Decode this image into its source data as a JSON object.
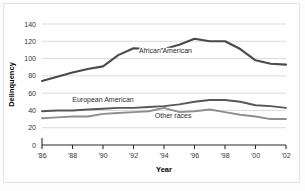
{
  "figure": {
    "background_color": "#ffffff",
    "border_color": "#e3e3e3"
  },
  "chart_data": {
    "type": "line",
    "title": "",
    "subtitle": "",
    "xlabel": "Year",
    "ylabel": "Delinquency",
    "xlim": [
      1986,
      2002
    ],
    "ylim": [
      0,
      140
    ],
    "grid": true,
    "grid_axis": "y",
    "legend_position": "inline-annotations",
    "x": [
      1986,
      1987,
      1988,
      1989,
      1990,
      1991,
      1992,
      1993,
      1994,
      1995,
      1996,
      1997,
      1998,
      1999,
      2000,
      2001,
      2002
    ],
    "xtick_values": [
      1986,
      1988,
      1990,
      1992,
      1994,
      1996,
      1998,
      2000,
      2002
    ],
    "xtick_labels": [
      "'86",
      "'88",
      "'90",
      "'92",
      "'94",
      "'96",
      "'98",
      "'00",
      "'02"
    ],
    "ytick_values": [
      0,
      20,
      40,
      60,
      80,
      100,
      120,
      140
    ],
    "ytick_labels": [
      "0",
      "20",
      "40",
      "60",
      "80",
      "100",
      "120",
      "140"
    ],
    "series": [
      {
        "name": "African American",
        "color": "#4a4a4a",
        "width": 2.1,
        "label_x": 1994.1,
        "label_y": 106,
        "values": [
          74,
          79,
          84,
          88,
          91,
          104,
          112,
          111,
          111,
          116,
          123,
          120,
          120,
          111,
          98,
          94,
          93
        ]
      },
      {
        "name": "European American",
        "color": "#575757",
        "width": 1.9,
        "label_x": 1990.0,
        "label_y": 50,
        "values": [
          39,
          40,
          40,
          41,
          42,
          43,
          43,
          44,
          45,
          47,
          50,
          52,
          52,
          50,
          46,
          45,
          43
        ]
      },
      {
        "name": "Other races",
        "color": "#8e8e8e",
        "width": 1.9,
        "label_x": 1994.6,
        "label_y": 31,
        "values": [
          31,
          32,
          33,
          33,
          36,
          37,
          38,
          39,
          43,
          38,
          39,
          41,
          38,
          35,
          33,
          30,
          30
        ]
      }
    ]
  }
}
